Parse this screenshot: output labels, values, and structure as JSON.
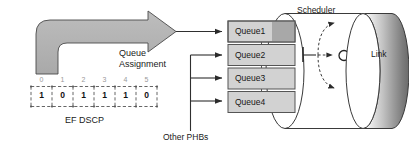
{
  "diagram": {
    "colors": {
      "arrow_fill": "#b0b0b0",
      "arrow_stroke": "#4d4d4d",
      "queue_fill": "#d2d2d2",
      "queue_fill_dark": "#a8a8a8",
      "queue_stroke": "#555555",
      "line": "#3a3a3a",
      "text": "#1a1a1a",
      "bit_index_text": "#9a9a9a",
      "cylinder_light": "#f2f2f2",
      "cylinder_dark": "#6e6e6e",
      "background": "#ffffff"
    }
  },
  "bitfield": {
    "label": "EF DSCP",
    "indices": [
      "0",
      "1",
      "2",
      "3",
      "4",
      "5"
    ],
    "values": [
      "1",
      "0",
      "1",
      "1",
      "1",
      "0"
    ]
  },
  "flow": {
    "queue_assignment_line1": "Queue",
    "queue_assignment_line2": "Assignment",
    "other_phbs_label": "Other PHBs"
  },
  "queues": [
    {
      "label": "Queue1"
    },
    {
      "label": "Queue2"
    },
    {
      "label": "Queue3"
    },
    {
      "label": "Queue4"
    }
  ],
  "scheduler": {
    "label": "Scheduler"
  },
  "link": {
    "label": "Link"
  }
}
